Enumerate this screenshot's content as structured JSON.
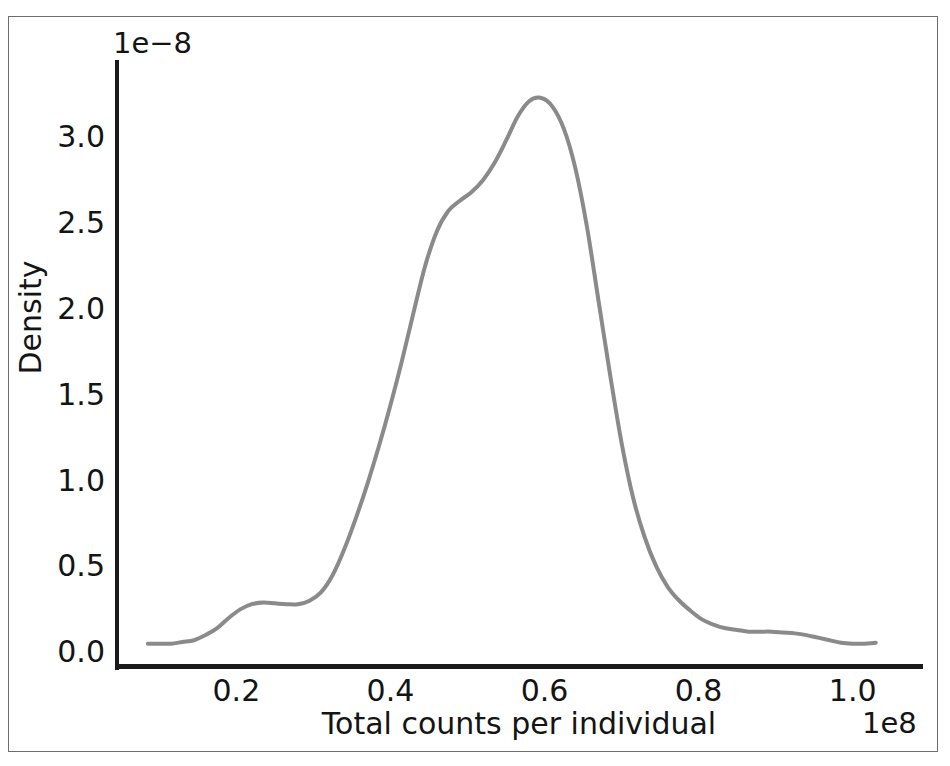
{
  "chart_data": {
    "type": "line",
    "title": "",
    "subtitle": "",
    "xlabel": "Total counts per individual",
    "ylabel": "Density",
    "x_offset_text": "1e8",
    "y_offset_text": "1e−8",
    "x_tick_labels": [
      "0.2",
      "0.4",
      "0.6",
      "0.8",
      "1.0"
    ],
    "x_tick_values": [
      0.2,
      0.4,
      0.6,
      0.8,
      1.0
    ],
    "y_tick_labels": [
      "0.0",
      "0.5",
      "1.0",
      "1.5",
      "2.0",
      "2.5",
      "3.0"
    ],
    "y_tick_values": [
      0.0,
      0.5,
      1.0,
      1.5,
      2.0,
      2.5,
      3.0
    ],
    "xlim": [
      0.045,
      1.09
    ],
    "ylim": [
      -0.08,
      3.45
    ],
    "x_scale_multiplier": 100000000.0,
    "y_scale_multiplier": 1e-08,
    "grid": false,
    "legend": null,
    "line_color": "#8a8a8a",
    "line_width": 4,
    "series": [
      {
        "name": "Density",
        "x": [
          0.085,
          0.1,
          0.115,
          0.13,
          0.145,
          0.16,
          0.175,
          0.19,
          0.205,
          0.22,
          0.235,
          0.25,
          0.265,
          0.28,
          0.295,
          0.31,
          0.325,
          0.34,
          0.355,
          0.37,
          0.385,
          0.4,
          0.415,
          0.43,
          0.445,
          0.46,
          0.475,
          0.49,
          0.505,
          0.52,
          0.535,
          0.55,
          0.565,
          0.58,
          0.595,
          0.61,
          0.625,
          0.64,
          0.655,
          0.67,
          0.685,
          0.7,
          0.715,
          0.73,
          0.745,
          0.76,
          0.775,
          0.79,
          0.805,
          0.82,
          0.835,
          0.85,
          0.865,
          0.88,
          0.895,
          0.91,
          0.925,
          0.94,
          0.955,
          0.97,
          0.985,
          1.0,
          1.015,
          1.03
        ],
        "y": [
          0.05,
          0.05,
          0.05,
          0.06,
          0.07,
          0.1,
          0.14,
          0.2,
          0.25,
          0.28,
          0.29,
          0.285,
          0.28,
          0.28,
          0.3,
          0.35,
          0.45,
          0.6,
          0.78,
          0.98,
          1.2,
          1.44,
          1.7,
          1.98,
          2.25,
          2.45,
          2.57,
          2.63,
          2.68,
          2.75,
          2.85,
          2.98,
          3.12,
          3.21,
          3.23,
          3.18,
          3.05,
          2.82,
          2.48,
          2.05,
          1.62,
          1.22,
          0.9,
          0.67,
          0.5,
          0.38,
          0.3,
          0.24,
          0.19,
          0.16,
          0.14,
          0.13,
          0.12,
          0.12,
          0.12,
          0.115,
          0.11,
          0.1,
          0.085,
          0.07,
          0.055,
          0.05,
          0.05,
          0.055
        ]
      }
    ],
    "annotations": {
      "peak_x": 0.59,
      "peak_y": 3.23,
      "shoulder_x": 0.49,
      "shoulder_y": 2.63,
      "left_bump_x": 0.235,
      "left_bump_y": 0.29
    }
  }
}
